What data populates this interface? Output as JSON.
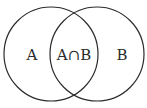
{
  "diagram": {
    "type": "venn",
    "sets": [
      {
        "id": "A",
        "label": "A"
      },
      {
        "id": "B",
        "label": "B"
      }
    ],
    "intersection_label": "A∩B",
    "stroke_color": "#2b2b2b",
    "background_color": "#ffffff"
  }
}
